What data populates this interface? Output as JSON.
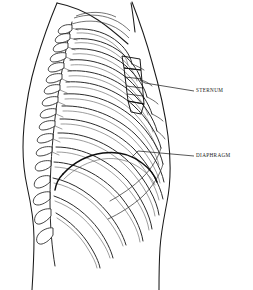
{
  "figure": {
    "view": "lateral-right",
    "background_color": "#ffffff",
    "line_color": "#1a1a1a",
    "width": 253,
    "height": 290
  },
  "labels": [
    {
      "id": "sternum",
      "text": "STERNUM",
      "text_x": 196,
      "text_y": 91,
      "leader_from_x": 194,
      "leader_from_y": 91,
      "leader_to_x": 145,
      "leader_to_y": 83
    },
    {
      "id": "diaphragm",
      "text": "DIAPHRAGM",
      "text_x": 196,
      "text_y": 156,
      "leader_from_x": 194,
      "leader_from_y": 156,
      "leader_to_x": 138,
      "leader_to_y": 151
    }
  ],
  "structures": {
    "ribcage": {
      "name": "Rib cage",
      "rib_pair_count": 12,
      "description": "Twelve paired ribs curving anteriorly from the vertebral column"
    },
    "vertebral_column": {
      "name": "Vertebral column",
      "vertebra_count": 17,
      "description": "Thoracic and lumbar vertebrae with posterior spinous processes"
    },
    "sternum": {
      "name": "Sternum",
      "description": "Manubrium, body and xiphoid process with costal articulations"
    },
    "diaphragm": {
      "name": "Diaphragm",
      "description": "Dome shaped muscle dividing thorax from abdomen"
    },
    "body_outline": {
      "name": "Torso silhouette",
      "description": "Neck, shoulder, back and abdominal contour"
    }
  },
  "colors": {
    "ink": "#1a1a1a",
    "rib_stroke": "#2b2b2b",
    "rib_light": "#5b5b5b",
    "accent": "#0d0d0d",
    "paper": "#ffffff"
  }
}
